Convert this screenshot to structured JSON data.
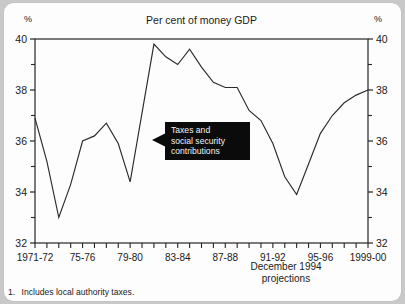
{
  "card": {
    "unit_left": "%",
    "unit_right": "%"
  },
  "callout": {
    "line1": "Taxes and",
    "line2": "social security",
    "line3": "contributions"
  },
  "projection_note": {
    "line1": "December 1994",
    "line2": "projections"
  },
  "footnote": {
    "number": "1.",
    "text": "Includes local authority taxes."
  },
  "chart_data": {
    "type": "line",
    "title": "Per cent of money GDP",
    "xlabel": "",
    "ylabel": "%",
    "ylim": [
      32,
      40
    ],
    "ytick_values": [
      32,
      34,
      36,
      38,
      40
    ],
    "ytick_labels": [
      "32",
      "34",
      "36",
      "38",
      "40"
    ],
    "yminor_values": [
      33,
      35,
      37,
      39
    ],
    "grid": false,
    "legend": "none",
    "axis_right_mirrored": true,
    "xtick_labels": [
      "1971-72",
      "75-76",
      "79-80",
      "83-84",
      "87-88",
      "91-92",
      "95-96",
      "1999-00"
    ],
    "xtick_label_years": [
      "1971-72",
      "1975-76",
      "1979-80",
      "1983-84",
      "1987-88",
      "1991-92",
      "1995-96",
      "1999-00"
    ],
    "x_minor_count": 29,
    "annotations": [
      "Taxes and social security contributions",
      "December 1994 projections"
    ],
    "series": [
      {
        "name": "Taxes and social security contributions",
        "x": [
          "1971-72",
          "1972-73",
          "1973-74",
          "1974-75",
          "1975-76",
          "1976-77",
          "1977-78",
          "1978-79",
          "1979-80",
          "1980-81",
          "1981-82",
          "1982-83",
          "1983-84",
          "1984-85",
          "1985-86",
          "1986-87",
          "1987-88",
          "1988-89",
          "1989-90",
          "1990-91",
          "1991-92",
          "1992-93",
          "1993-94",
          "1994-95",
          "1995-96",
          "1996-97",
          "1997-98",
          "1998-99",
          "1999-00"
        ],
        "values": [
          36.9,
          35.2,
          33.0,
          34.3,
          36.0,
          36.2,
          36.7,
          35.9,
          34.4,
          37.1,
          39.8,
          39.3,
          39.0,
          39.6,
          38.9,
          38.3,
          38.1,
          38.1,
          37.2,
          36.8,
          35.9,
          34.6,
          33.9,
          35.1,
          36.3,
          37.0,
          37.5,
          37.8,
          38.0
        ]
      }
    ]
  }
}
